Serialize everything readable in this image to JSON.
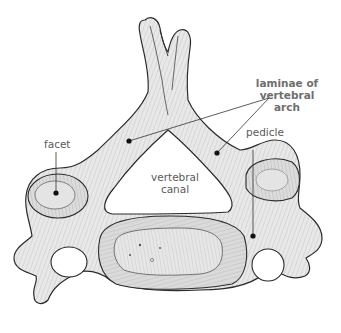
{
  "diagram": {
    "labels": {
      "laminae": {
        "line1": "laminae of",
        "line2": "vertebral",
        "line3": "arch"
      },
      "facet": "facet",
      "vertebral_canal": {
        "line1": "vertebral",
        "line2": "canal"
      },
      "pedicle": "pedicle"
    },
    "colors": {
      "bone_fill": "#e6e6e6",
      "bone_shade": "#d4d4d4",
      "outline": "#2a2a2a",
      "hatch": "#555555",
      "label_text": "#5a5a5a",
      "leader_line": "#333333",
      "background": "#ffffff"
    }
  }
}
